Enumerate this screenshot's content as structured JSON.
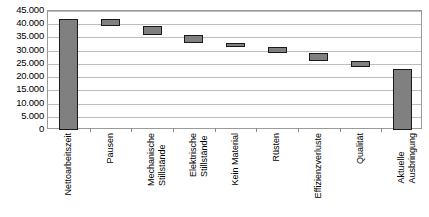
{
  "chart_data": {
    "type": "bar",
    "subtype": "waterfall",
    "title": "",
    "xlabel": "",
    "ylabel": "",
    "ylim": [
      0,
      45000
    ],
    "ytick_step": 5000,
    "grid": true,
    "legend": false,
    "number_format": "de-DE",
    "bar_color": "#808080",
    "bar_border_color": "#1a1a1a",
    "gridline_color": "#bdbdbd",
    "frame_color": "#9a9a9a",
    "categories": [
      "Nettoarbeitszeit",
      "Pausen",
      "Mechanische Stillstände",
      "Elektrische Stillstände",
      "Kein Material",
      "Rüsten",
      "Effizienzverluste",
      "Qualität",
      "Aktuelle Ausbringung"
    ],
    "category_lines": [
      [
        "Nettoarbeitszeit"
      ],
      [
        "Pausen"
      ],
      [
        "Mechanische",
        "Stillstände"
      ],
      [
        "Elektrische",
        "Stillstände"
      ],
      [
        "Kein Material"
      ],
      [
        "Rüsten"
      ],
      [
        "Effizienzverluste"
      ],
      [
        "Qualität"
      ],
      [
        "Aktuelle",
        "Ausbringung"
      ]
    ],
    "ytick_labels": [
      "45.000",
      "40.000",
      "35.000",
      "30.000",
      "25.000",
      "20.000",
      "15.000",
      "10.000",
      "5.000",
      "0"
    ],
    "ytick_values": [
      45000,
      40000,
      35000,
      30000,
      25000,
      20000,
      15000,
      10000,
      5000,
      0
    ],
    "bars": [
      {
        "label": "Nettoarbeitszeit",
        "base": 0,
        "top": 42000,
        "value": 42000,
        "kind": "total"
      },
      {
        "label": "Pausen",
        "base": 39500,
        "top": 42000,
        "value": -2500,
        "kind": "decrease"
      },
      {
        "label": "Mechanische Stillstände",
        "base": 36000,
        "top": 39500,
        "value": -3500,
        "kind": "decrease"
      },
      {
        "label": "Elektrische Stillstände",
        "base": 33000,
        "top": 36000,
        "value": -3000,
        "kind": "decrease"
      },
      {
        "label": "Kein Material",
        "base": 31500,
        "top": 33000,
        "value": -1500,
        "kind": "decrease"
      },
      {
        "label": "Rüsten",
        "base": 29000,
        "top": 31500,
        "value": -2500,
        "kind": "decrease"
      },
      {
        "label": "Effizienzverluste",
        "base": 26000,
        "top": 29000,
        "value": -3000,
        "kind": "decrease"
      },
      {
        "label": "Qualität",
        "base": 24000,
        "top": 26000,
        "value": -2000,
        "kind": "decrease"
      },
      {
        "label": "Aktuelle Ausbringung",
        "base": 0,
        "top": 23000,
        "value": 23000,
        "kind": "total"
      }
    ]
  }
}
